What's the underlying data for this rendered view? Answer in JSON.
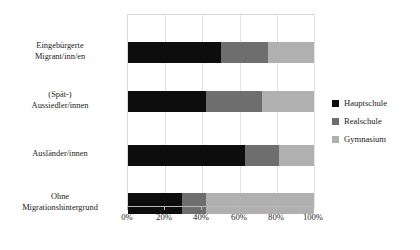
{
  "chart_data": {
    "type": "bar",
    "orientation": "horizontal",
    "stacked": true,
    "normalized": true,
    "title": "",
    "xlabel": "",
    "ylabel": "",
    "xlim": [
      0,
      100
    ],
    "grid": true,
    "legend_position": "right",
    "categories": [
      [
        "Eingebürgerte",
        "Migrant/inn/en"
      ],
      [
        "(Spät-)",
        "Aussiedler/innen"
      ],
      [
        "Ausländer/innen"
      ],
      [
        "Ohne",
        "Migrationshintergrund"
      ]
    ],
    "xtick_labels": [
      "0%",
      "20%",
      "40%",
      "60%",
      "80%",
      "100%"
    ],
    "xtick_values": [
      0,
      20,
      40,
      60,
      80,
      100
    ],
    "series": [
      {
        "name": "Hauptschule",
        "color": "#0d0d0d",
        "values": [
          50,
          42,
          63,
          29
        ]
      },
      {
        "name": "Realschule",
        "color": "#6e6e6e",
        "values": [
          25,
          30,
          18,
          13
        ]
      },
      {
        "name": "Gymnasium",
        "color": "#b0b0b0",
        "values": [
          25,
          28,
          19,
          58
        ]
      }
    ]
  }
}
